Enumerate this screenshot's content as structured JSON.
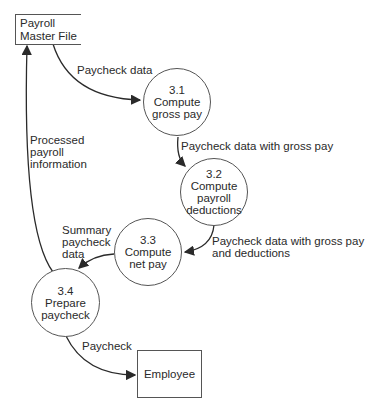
{
  "entities": {
    "payroll_master_file": {
      "line1": "Payroll",
      "line2": "Master File"
    },
    "employee": {
      "label": "Employee"
    }
  },
  "processes": [
    {
      "id": "3.1",
      "line1": "Compute",
      "line2": "gross pay",
      "line3": ""
    },
    {
      "id": "3.2",
      "line1": "Compute",
      "line2": "payroll",
      "line3": "deductions"
    },
    {
      "id": "3.3",
      "line1": "Compute",
      "line2": "net pay",
      "line3": ""
    },
    {
      "id": "3.4",
      "line1": "Prepare",
      "line2": "paycheck",
      "line3": ""
    }
  ],
  "flows": {
    "paycheck_data": "Paycheck data",
    "with_gross_pay": "Paycheck data with gross pay",
    "with_deductions_1": "Paycheck data with gross pay",
    "with_deductions_2": "and deductions",
    "summary_1": "Summary",
    "summary_2": "paycheck",
    "summary_3": "data",
    "processed_1": "Processed",
    "processed_2": "payroll",
    "processed_3": "information",
    "paycheck": "Paycheck"
  },
  "colors": {
    "line": "#2a2a2a",
    "border": "#555555"
  }
}
